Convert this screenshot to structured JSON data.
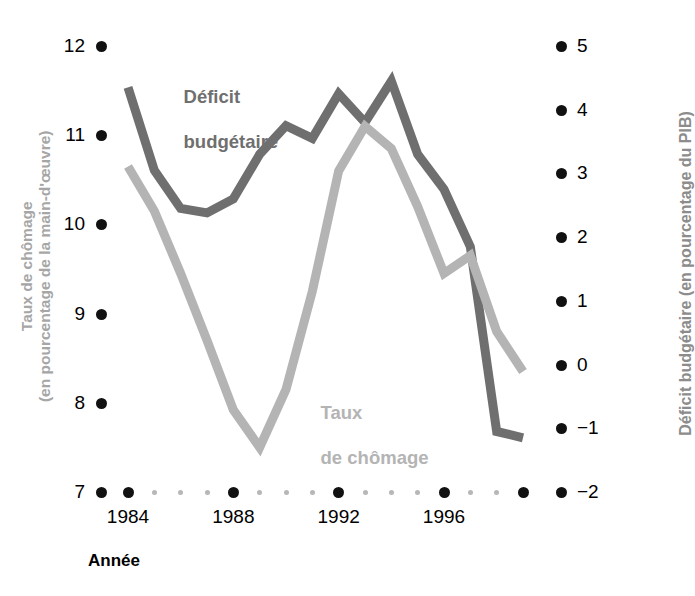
{
  "chart_data": {
    "type": "line",
    "title": "",
    "xlabel": "Année",
    "x": [
      1984,
      1985,
      1986,
      1987,
      1988,
      1989,
      1990,
      1991,
      1992,
      1993,
      1994,
      1995,
      1996,
      1997,
      1998,
      1999
    ],
    "xtick_labels": [
      "1984",
      "1988",
      "1992",
      "1996"
    ],
    "xtick_values": [
      1984,
      1988,
      1992,
      1996
    ],
    "xlim": [
      1984,
      1999
    ],
    "grid": false,
    "legend_position": "inline-annotations",
    "axes": [
      {
        "id": "left",
        "label": "Taux de chômage\n(en pourcentage de la main-d'œuvre)",
        "label_line1": "Taux de chômage",
        "label_line2": "(en pourcentage de la main-d'œuvre)",
        "ticks": [
          12,
          11,
          10,
          9,
          8,
          7
        ],
        "tick_labels": [
          "12",
          "11",
          "10",
          "9",
          "8",
          "7"
        ],
        "lim": [
          7,
          12
        ],
        "color": "#a6a6a6"
      },
      {
        "id": "right",
        "label": "Déficit budgétaire (en pourcentage du PIB)",
        "ticks": [
          5,
          4,
          3,
          2,
          1,
          0,
          -1,
          -2
        ],
        "tick_labels": [
          "5",
          "4",
          "3",
          "2",
          "1",
          "0",
          "−1",
          "−2"
        ],
        "lim": [
          -2,
          5
        ],
        "color": "#8c8c8c"
      }
    ],
    "series": [
      {
        "name": "Déficit budgétaire",
        "label_line1": "Déficit",
        "label_line2": "budgétaire",
        "axis": "right",
        "color": "#6f6f6f",
        "stroke_width": 9,
        "values": [
          4.35,
          3.05,
          2.45,
          2.38,
          2.6,
          3.3,
          3.75,
          3.55,
          4.25,
          3.8,
          4.45,
          3.3,
          2.75,
          1.85,
          -1.05,
          -1.15
        ]
      },
      {
        "name": "Taux de chômage",
        "label_line1": "Taux",
        "label_line2": "de chômage",
        "axis": "left",
        "color": "#b4b4b4",
        "stroke_width": 9,
        "values": [
          10.65,
          10.15,
          9.45,
          8.7,
          7.92,
          7.5,
          8.15,
          9.25,
          10.6,
          11.1,
          10.85,
          10.2,
          9.45,
          9.65,
          8.8,
          8.35
        ]
      }
    ]
  },
  "annotations": {
    "deficit_label_line1": "Déficit",
    "deficit_label_line2": "budgétaire",
    "chomage_label_line1": "Taux",
    "chomage_label_line2": "de chômage"
  },
  "axis_titles": {
    "left_line1": "Taux de chômage",
    "left_line2": "(en pourcentage de la main-d'œuvre)",
    "right": "Déficit budgétaire (en pourcentage du PIB)",
    "x": "Année"
  }
}
